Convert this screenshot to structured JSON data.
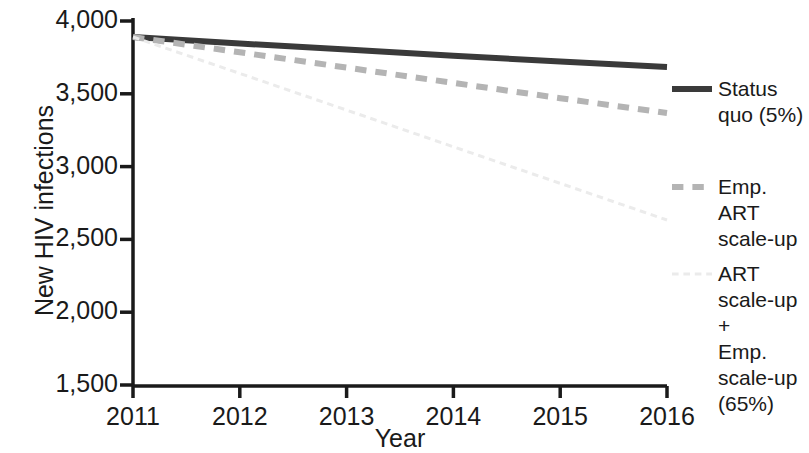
{
  "chart_data": {
    "type": "line",
    "title": "",
    "xlabel": "Year",
    "ylabel": "New HIV infections",
    "x": [
      2011,
      2012,
      2013,
      2014,
      2015,
      2016
    ],
    "xtick_labels": [
      "2011",
      "2012",
      "2013",
      "2014",
      "2015",
      "2016"
    ],
    "ytick_labels": [
      "4,000",
      "3,500",
      "3,000",
      "2,500",
      "2,000",
      "1,500"
    ],
    "ytick_values": [
      4000,
      3500,
      3000,
      2500,
      2000,
      1500
    ],
    "xlim": [
      2011,
      2016
    ],
    "ylim": [
      1500,
      4000
    ],
    "grid": false,
    "legend_position": "right",
    "series": [
      {
        "name": "Status quo (5%)",
        "legend_label": "Status\nquo (5%)",
        "style": "solid",
        "color": "#3a3a3a",
        "width": 6,
        "values": [
          3890,
          3845,
          3805,
          3762,
          3722,
          3684
        ]
      },
      {
        "name": "Emp. ART scale-up",
        "legend_label": "Emp. ART\nscale-up",
        "style": "dashed",
        "color": "#b4b4b4",
        "width": 6,
        "values": [
          3890,
          3785,
          3680,
          3575,
          3470,
          3368
        ]
      },
      {
        "name": "ART scale-up + Emp. scale-up (65%)",
        "legend_label": "ART\nscale-up +\nEmp.\nscale-up\n(65%)",
        "style": "dotted",
        "color": "#ebebeb",
        "width": 3,
        "values": [
          3890,
          3640,
          3388,
          3136,
          2885,
          2633
        ]
      }
    ]
  },
  "axes": {
    "y_title": "New HIV infections",
    "x_title": "Year"
  }
}
